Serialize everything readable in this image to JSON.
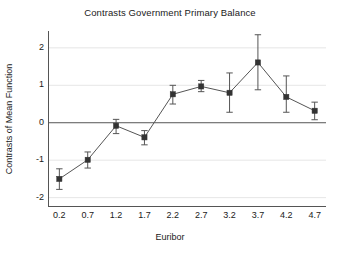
{
  "chart_data": {
    "type": "line",
    "title": "Contrasts Government Primary Balance",
    "xlabel": "Euribor",
    "ylabel": "Contrasts of Mean Function",
    "x": [
      0.2,
      0.7,
      1.2,
      1.7,
      2.2,
      2.7,
      3.2,
      3.7,
      4.2,
      4.7
    ],
    "xtick_labels": [
      "0.2",
      "0.7",
      "1.2",
      "1.7",
      "2.2",
      "2.7",
      "3.2",
      "3.7",
      "4.2",
      "4.7"
    ],
    "ytick_labels": [
      "2",
      "1",
      "0",
      "-1",
      "-2"
    ],
    "yticks": [
      2,
      1,
      0,
      -1,
      -2
    ],
    "values": [
      -1.5,
      -0.99,
      -0.08,
      -0.39,
      0.76,
      0.97,
      0.8,
      1.61,
      0.69,
      0.32
    ],
    "error_low": [
      -1.78,
      -1.21,
      -0.29,
      -0.59,
      0.5,
      0.83,
      0.28,
      0.88,
      0.28,
      0.08
    ],
    "error_high": [
      -1.23,
      -0.78,
      0.09,
      -0.21,
      1.0,
      1.13,
      1.33,
      2.35,
      1.25,
      0.55
    ],
    "xlim": [
      0.0,
      4.9
    ],
    "ylim": [
      -2.25,
      2.45
    ],
    "grid": true,
    "grid_axis": "y",
    "legend": "none",
    "zero_line": 0,
    "marker": "filled-square",
    "series_name": "Contrasts of Mean Function",
    "colors": {
      "line": "#555555",
      "marker": "#333333",
      "error_bar": "#555555",
      "grid": "#e6e6e6",
      "axis": "#555555",
      "zero_line": "#555555",
      "background": "#ffffff",
      "text": "#1a1a1a"
    }
  }
}
